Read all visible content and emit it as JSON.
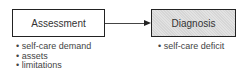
{
  "diagram": {
    "nodes": [
      {
        "id": "assessment",
        "label": "Assessment",
        "items": [
          "self-care demand",
          "assets",
          "limitations"
        ]
      },
      {
        "id": "diagnosis",
        "label": "Diagnosis",
        "items": [
          "self-care deficit"
        ]
      }
    ],
    "edges": [
      {
        "from": "assessment",
        "to": "diagnosis"
      }
    ]
  }
}
